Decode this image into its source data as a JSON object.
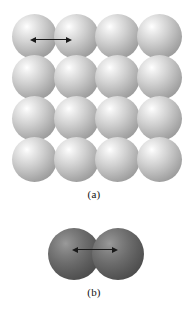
{
  "figure": {
    "background_color": "#ffffff",
    "panels": [
      {
        "id": "a",
        "caption": "(a)",
        "description": "close-packed array of atoms represented as light gray spheres",
        "sphere_color": "#bdbdbd",
        "sphere_highlight_color": "#ffffff",
        "grid": {
          "rows": 4,
          "columns": 4,
          "sphere_diameter_px": 45,
          "spacing_px": 41.5
        },
        "annotation": {
          "type": "double-headed-arrow",
          "color": "#1a1a1a",
          "orientation": "horizontal",
          "description": "distance between centers of two adjacent touching spheres"
        }
      },
      {
        "id": "b",
        "caption": "(b)",
        "description": "two interpenetrating dark gray spheres sharing a bond",
        "sphere_color": "#5e5e5e",
        "sphere_highlight_color": "#9a9a9a",
        "sphere_count": 2,
        "sphere_diameter_px": 52,
        "annotation": {
          "type": "double-headed-arrow",
          "color": "#1a1a1a",
          "orientation": "horizontal",
          "description": "distance between centers of the two bonded spheres"
        }
      }
    ]
  }
}
